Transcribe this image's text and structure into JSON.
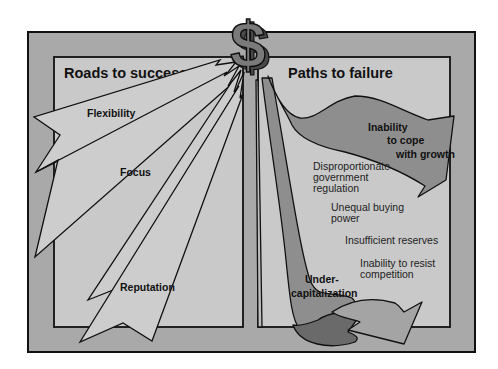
{
  "diagram": {
    "symbol": "$",
    "colors": {
      "outer_frame": "#a9a9a9",
      "inner_panel": "#c9c9c9",
      "success_arrow": "#cdcdcd",
      "failure_stream": "#8e8e8e",
      "failure_dark": "#6a6a6a",
      "dollar": "#7a7a7a",
      "outline": "#111111"
    },
    "left_panel": {
      "title": "Roads to success",
      "arrows": [
        {
          "label": "Flexibility"
        },
        {
          "label": "Focus"
        },
        {
          "label": "Reputation"
        }
      ]
    },
    "right_panel": {
      "title": "Paths to failure",
      "major_paths": [
        {
          "label_lines": [
            "Inability",
            "to cope",
            "with growth"
          ]
        },
        {
          "label_lines": [
            "Under-",
            "capitalization"
          ]
        }
      ],
      "minor_paths": [
        {
          "label_lines": [
            "Disproportionate",
            "government",
            "regulation"
          ]
        },
        {
          "label_lines": [
            "Unequal buying",
            "power"
          ]
        },
        {
          "label_lines": [
            "Insufficient reserves"
          ]
        },
        {
          "label_lines": [
            "Inability to resist",
            "competition"
          ]
        }
      ]
    }
  }
}
